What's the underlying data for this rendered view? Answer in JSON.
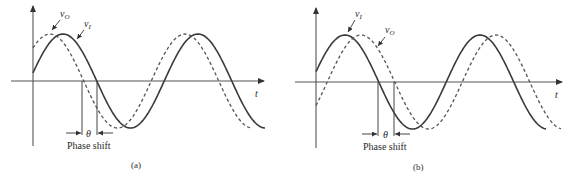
{
  "figure": {
    "panels": [
      {
        "id": "a",
        "caption": "(a)",
        "axis_label_t": "t",
        "label_vo": "v",
        "label_vo_sub": "O",
        "label_vi": "v",
        "label_vi_sub": "I",
        "theta": "θ",
        "phase_shift_label": "Phase shift",
        "description": "Output v_O leads input v_I (dashed curve shifted left)"
      },
      {
        "id": "b",
        "caption": "(b)",
        "axis_label_t": "t",
        "label_vo": "v",
        "label_vo_sub": "O",
        "label_vi": "v",
        "label_vi_sub": "I",
        "theta": "θ",
        "phase_shift_label": "Phase shift",
        "description": "Output v_O lags input v_I (dashed curve shifted right)"
      }
    ],
    "colors": {
      "solid_curve": "#3a3a3a",
      "dashed_curve": "#555555",
      "axis": "#555555",
      "background": "#ffffff"
    }
  },
  "chart_data": [
    {
      "type": "line",
      "title": "(a)",
      "xlabel": "t",
      "ylabel": "",
      "series": [
        {
          "name": "v_I",
          "style": "solid",
          "origin_px": [
            33,
            81
          ],
          "amplitude_px": 47,
          "period_px": 135,
          "first_peak_x_px": 63,
          "start_x_px": 33,
          "end_x_px": 265
        },
        {
          "name": "v_O",
          "style": "dashed",
          "origin_px": [
            33,
            81
          ],
          "amplitude_px": 47,
          "period_px": 135,
          "first_peak_x_px": 50,
          "start_x_px": 33,
          "end_x_px": 250
        }
      ],
      "annotations": [
        {
          "text": "θ",
          "meaning": "phase shift between zero crossings",
          "x_from_px": 82,
          "x_to_px": 97
        },
        {
          "text": "Phase shift"
        }
      ]
    },
    {
      "type": "line",
      "title": "(b)",
      "xlabel": "t",
      "ylabel": "",
      "series": [
        {
          "name": "v_I",
          "style": "solid",
          "origin_px": [
            316,
            82
          ],
          "amplitude_px": 47,
          "period_px": 135,
          "first_peak_x_px": 345,
          "start_x_px": 316,
          "end_x_px": 546
        },
        {
          "name": "v_O",
          "style": "dashed",
          "origin_px": [
            316,
            82
          ],
          "amplitude_px": 47,
          "period_px": 135,
          "first_peak_x_px": 361,
          "start_x_px": 316,
          "end_x_px": 561
        }
      ],
      "annotations": [
        {
          "text": "θ",
          "meaning": "phase shift between zero crossings",
          "x_from_px": 378,
          "x_to_px": 394
        },
        {
          "text": "Phase shift"
        }
      ]
    }
  ]
}
